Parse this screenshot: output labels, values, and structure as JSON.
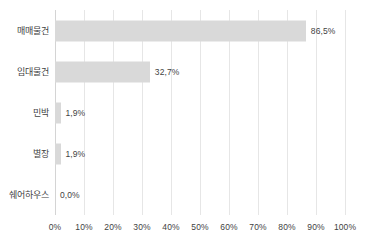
{
  "chart_data": {
    "type": "bar",
    "orientation": "horizontal",
    "title": "",
    "xlabel": "",
    "ylabel": "",
    "xlim": [
      0,
      100
    ],
    "grid": true,
    "legend": false,
    "categories": [
      "매매물건",
      "임대물건",
      "민박",
      "별장",
      "쉐어하우스"
    ],
    "values": [
      86.5,
      32.7,
      1.9,
      1.9,
      0.0
    ],
    "value_labels": [
      "86,5%",
      "32,7%",
      "1,9%",
      "1,9%",
      "0,0%"
    ],
    "xticks": [
      0,
      10,
      20,
      30,
      40,
      50,
      60,
      70,
      80,
      90,
      100
    ],
    "xtick_labels": [
      "0%",
      "10%",
      "20%",
      "30%",
      "40%",
      "50%",
      "60%",
      "70%",
      "80%",
      "90%",
      "100%"
    ],
    "bar_color": "#d9d9d9",
    "gridline_color": "#e6e6e6",
    "text_color": "#3f3f3f",
    "background_color": "#ffffff"
  }
}
